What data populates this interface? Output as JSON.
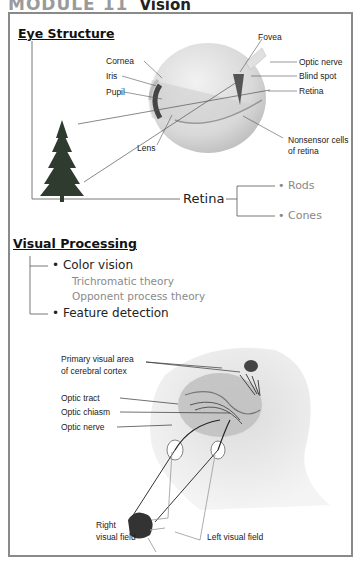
{
  "header": {
    "module": "MODULE 11",
    "title": "Vision"
  },
  "eye_structure": {
    "heading": "Eye Structure",
    "labels": {
      "fovea": "Fovea",
      "cornea": "Cornea",
      "optic_nerve": "Optic nerve",
      "iris": "Iris",
      "blind_spot": "Blind spot",
      "pupil": "Pupil",
      "retina": "Retina",
      "lens": "Lens",
      "nonsensor_1": "Nonsensor cells",
      "nonsensor_2": "of retina"
    },
    "retina_branch": {
      "root": "Retina",
      "children": [
        "• Rods",
        "• Cones"
      ]
    }
  },
  "visual_processing": {
    "heading": "Visual Processing",
    "items": [
      {
        "label": "• Color vision",
        "sub": [
          "Trichromatic theory",
          "Opponent process theory"
        ]
      },
      {
        "label": "• Feature detection"
      }
    ]
  },
  "brain_diagram": {
    "labels": {
      "primary_1": "Primary visual area",
      "primary_2": "of cerebral cortex",
      "optic_tract": "Optic tract",
      "optic_chiasm": "Optic chiasm",
      "optic_nerve": "Optic nerve",
      "right_1": "Right",
      "right_2": "visual field",
      "left": "Left visual field"
    }
  },
  "colors": {
    "frame": "#8a8a8a",
    "text": "#222222",
    "muted": "#888888"
  }
}
